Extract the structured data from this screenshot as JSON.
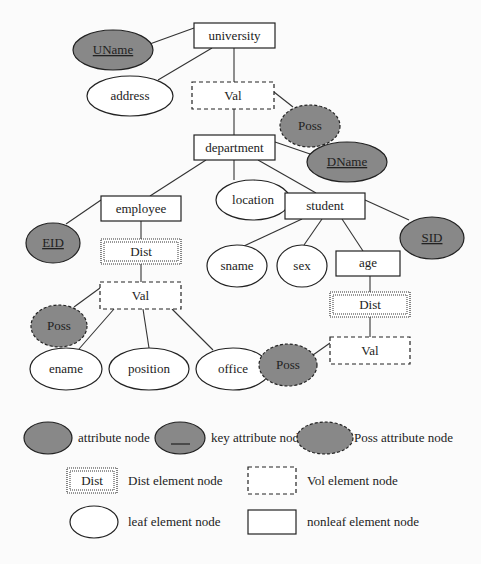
{
  "diagram": {
    "nodes": {
      "university": "university",
      "uname": "UName",
      "address": "address",
      "val_top": "Val",
      "poss_top": "Poss",
      "department": "department",
      "dname": "DName",
      "location": "location",
      "employee": "employee",
      "student": "student",
      "eid": "EID",
      "sid": "SID",
      "dist_emp": "Dist",
      "val_emp": "Val",
      "poss_emp": "Poss",
      "ename": "ename",
      "position": "position",
      "office": "office",
      "sname": "sname",
      "sex": "sex",
      "age": "age",
      "dist_age": "Dist",
      "val_age": "Val",
      "poss_age": "Poss"
    },
    "edges": [
      [
        "university",
        "uname"
      ],
      [
        "university",
        "address"
      ],
      [
        "university",
        "val_top"
      ],
      [
        "val_top",
        "poss_top"
      ],
      [
        "val_top",
        "department"
      ],
      [
        "department",
        "dname"
      ],
      [
        "department",
        "location"
      ],
      [
        "department",
        "employee"
      ],
      [
        "department",
        "student"
      ],
      [
        "employee",
        "eid"
      ],
      [
        "employee",
        "dist_emp"
      ],
      [
        "dist_emp",
        "val_emp"
      ],
      [
        "val_emp",
        "poss_emp"
      ],
      [
        "val_emp",
        "ename"
      ],
      [
        "val_emp",
        "position"
      ],
      [
        "val_emp",
        "office"
      ],
      [
        "student",
        "sid"
      ],
      [
        "student",
        "sname"
      ],
      [
        "student",
        "sex"
      ],
      [
        "student",
        "age"
      ],
      [
        "age",
        "dist_age"
      ],
      [
        "dist_age",
        "val_age"
      ],
      [
        "val_age",
        "poss_age"
      ]
    ]
  },
  "legend": {
    "attribute": "attribute node",
    "key_attribute": "key attribute node",
    "poss_attribute": "Poss attribute node",
    "dist_sample": "Dist",
    "dist_element": "Dist element node",
    "vol_element": "Vol element node",
    "leaf_element": "leaf element node",
    "nonleaf_element": "nonleaf element node"
  },
  "colors": {
    "attribute_fill": "#888888",
    "stroke": "#222222",
    "background": "#fbfbfb"
  }
}
